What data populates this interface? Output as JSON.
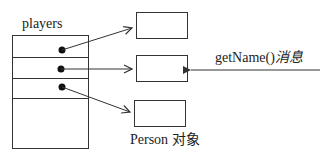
{
  "diagram": {
    "array_label": "players",
    "array_slots": 4,
    "objects_label": "Person 对象",
    "message": {
      "method": "getName()",
      "suffix": "消息"
    },
    "colors": {
      "stroke": "#333333",
      "dot": "#111111",
      "background": "#ffffff"
    }
  }
}
